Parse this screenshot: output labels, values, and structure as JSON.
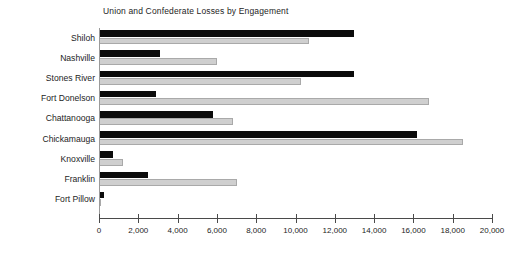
{
  "chart_data": {
    "type": "bar",
    "orientation": "horizontal",
    "title": "Union and Confederate Losses by Engagement",
    "xlabel": "",
    "ylabel": "",
    "xlim": [
      0,
      20000
    ],
    "xticks": [
      0,
      2000,
      4000,
      6000,
      8000,
      10000,
      12000,
      14000,
      16000,
      18000,
      20000
    ],
    "xtick_labels": [
      "0",
      "2,000",
      "4,000",
      "6,000",
      "8,000",
      "10,000",
      "12,000",
      "14,000",
      "16,000",
      "18,000",
      "20,000"
    ],
    "grid": false,
    "legend": null,
    "categories": [
      "Shiloh",
      "Nashville",
      "Stones River",
      "Fort Donelson",
      "Chattanooga",
      "Chickamauga",
      "Knoxville",
      "Franklin",
      "Fort Pillow"
    ],
    "series": [
      {
        "name": "Union",
        "color": "#0b0b0b",
        "values": [
          13000,
          3100,
          13000,
          2900,
          5800,
          16200,
          700,
          2500,
          230
        ]
      },
      {
        "name": "Confederate",
        "color": "#cfcfcf",
        "values": [
          10700,
          6000,
          10300,
          16800,
          6800,
          18500,
          1200,
          7000,
          100
        ]
      }
    ]
  },
  "colors": {
    "union_bar": "#0b0b0b",
    "confederate_bar": "#cfcfcf",
    "confederate_bar_border": "#a9a9a9",
    "axis": "#4a4a4a",
    "text": "#1d1d1d",
    "background": "#ffffff"
  }
}
